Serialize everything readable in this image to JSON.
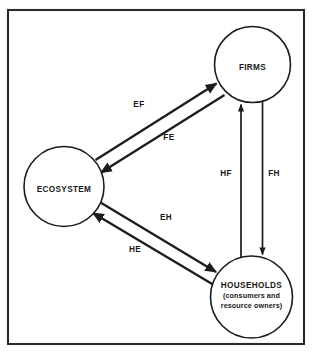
{
  "diagram": {
    "frame": {
      "name": "outer-border"
    },
    "nodes": [
      {
        "id": "firms",
        "label": "FIRMS",
        "sublabels": [],
        "cx": 252.5,
        "cy": 64.5,
        "r": 38.0
      },
      {
        "id": "ecosystem",
        "label": "ECOSYSTEM",
        "sublabels": [],
        "cx": 64.0,
        "cy": 186.5,
        "r": 40.0
      },
      {
        "id": "households",
        "label": "HOUSEHOLDS",
        "sublabels": [
          "(consumers and",
          "resource owners)"
        ],
        "cx": 251.5,
        "cy": 297.0,
        "r": 41.0
      }
    ],
    "flows": [
      {
        "id": "ef",
        "label": "EF",
        "from": "ecosystem",
        "to": "firms",
        "label_x": 139,
        "label_y": 105
      },
      {
        "id": "fe",
        "label": "FE",
        "from": "firms",
        "to": "ecosystem",
        "label_x": 169,
        "label_y": 138
      },
      {
        "id": "hf",
        "label": "HF",
        "from": "households",
        "to": "firms",
        "label_x": 226,
        "label_y": 174
      },
      {
        "id": "fh",
        "label": "FH",
        "from": "firms",
        "to": "households",
        "label_x": 273,
        "label_y": 174
      },
      {
        "id": "eh",
        "label": "EH",
        "from": "ecosystem",
        "to": "households",
        "label_x": 166,
        "label_y": 218
      },
      {
        "id": "he",
        "label": "HE",
        "from": "households",
        "to": "ecosystem",
        "label_x": 135,
        "label_y": 250
      }
    ],
    "colors": {
      "background": "#ffffff",
      "stroke": "#1c1c1c",
      "frame": "#2a2a2a",
      "text": "#1a1a1a"
    }
  }
}
